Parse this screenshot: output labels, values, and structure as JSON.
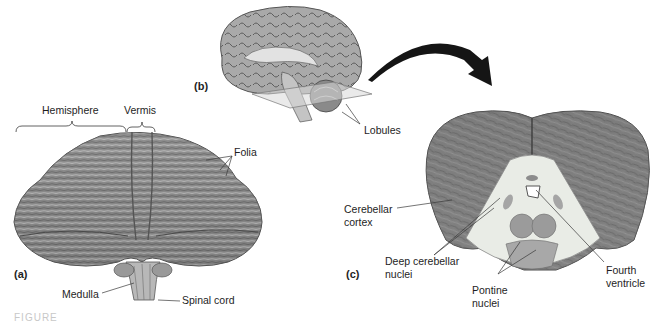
{
  "figure": {
    "caption_fragment": "FIGURE",
    "panels": {
      "a": {
        "tag": "(a)",
        "view": "posterior view of cerebellum",
        "labels": {
          "hemisphere": "Hemisphere",
          "vermis": "Vermis",
          "folia": "Folia",
          "medulla": "Medulla",
          "spinal_cord": "Spinal cord"
        }
      },
      "b": {
        "tag": "(b)",
        "view": "midsagittal brain with section plane",
        "labels": {
          "lobules": "Lobules"
        }
      },
      "c": {
        "tag": "(c)",
        "view": "transverse section of cerebellum",
        "labels": {
          "cerebellar_cortex_1": "Cerebellar",
          "cerebellar_cortex_2": "cortex",
          "deep_nuclei_1": "Deep cerebellar",
          "deep_nuclei_2": "nuclei",
          "pontine_1": "Pontine",
          "pontine_2": "nuclei",
          "fourth_1": "Fourth",
          "fourth_2": "ventricle"
        }
      }
    },
    "colors": {
      "tissue_dark": "#6e6e6e",
      "tissue_mid": "#8c8c8c",
      "tissue_light": "#b4b4b4",
      "white_matter": "#e9ece6",
      "nuclei": "#9b9b9b",
      "leader_line": "#3a3a3a",
      "arrow": "#151515"
    }
  }
}
